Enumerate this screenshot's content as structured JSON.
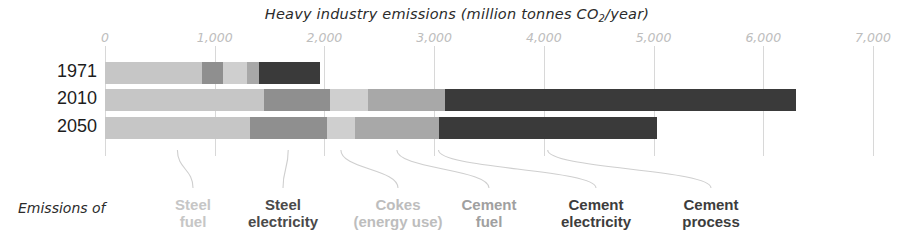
{
  "chart_data": {
    "type": "bar",
    "orientation": "horizontal",
    "stacked": true,
    "title": "Heavy industry emissions (million tonnes CO2/year)",
    "title_prefix": "Heavy industry emissions (million tonnes CO",
    "title_sub": "2",
    "title_suffix": "/year)",
    "xlabel": "",
    "ylabel": "",
    "xlim": [
      0,
      7000
    ],
    "grid": true,
    "legend_position": "bottom",
    "tick_labels": [
      "0",
      "1,000",
      "2,000",
      "3,000",
      "4,000",
      "5,000",
      "6,000",
      "7,000"
    ],
    "tick_values": [
      0,
      1000,
      2000,
      3000,
      4000,
      5000,
      6000,
      7000
    ],
    "categories": [
      "1971",
      "2010",
      "2050"
    ],
    "series": [
      {
        "name": "Steel fuel",
        "color": "#c6c6c6",
        "values": [
          880,
          1450,
          1320
        ]
      },
      {
        "name": "Steel electricity",
        "color": "#8f8f8f",
        "values": [
          200,
          600,
          700
        ]
      },
      {
        "name": "Cokes (energy use)",
        "color": "#cfcfcf",
        "values": [
          210,
          350,
          260
        ]
      },
      {
        "name": "Cement fuel",
        "color": "#a8a8a8",
        "values": [
          110,
          700,
          760
        ]
      },
      {
        "name": "Cement electricity",
        "color": "#6e6e6e",
        "values": [
          0,
          0,
          0
        ]
      },
      {
        "name": "Cement process",
        "color": "#3a3a3a",
        "values": [
          560,
          3200,
          1990
        ]
      }
    ],
    "totals": [
      1960,
      6300,
      5030
    ],
    "annotations": {
      "emissions_of": "Emissions of"
    }
  },
  "legend": {
    "lead_in": "Emissions of",
    "items": [
      {
        "label": "Steel\nfuel",
        "color": "#c6c6c6"
      },
      {
        "label": "Steel\nelectricity",
        "color": "#4a4a4a"
      },
      {
        "label": "Cokes\n(energy use)",
        "color": "#bdbdbd"
      },
      {
        "label": "Cement\nfuel",
        "color": "#a0a0a0"
      },
      {
        "label": "Cement\nelectricity",
        "color": "#3d3d3d"
      },
      {
        "label": "Cement\nprocess",
        "color": "#3d3d3d"
      }
    ]
  }
}
